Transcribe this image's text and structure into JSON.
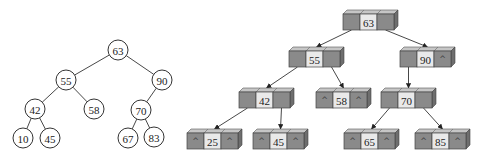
{
  "left_tree": {
    "title": "Binary search tree (logical view)",
    "nodes": [
      {
        "id": "n63",
        "value": "63",
        "x": 118,
        "y": 50
      },
      {
        "id": "n55",
        "value": "55",
        "x": 66,
        "y": 80
      },
      {
        "id": "n90",
        "value": "90",
        "x": 162,
        "y": 80
      },
      {
        "id": "n42",
        "value": "42",
        "x": 35,
        "y": 109
      },
      {
        "id": "n58",
        "value": "58",
        "x": 94,
        "y": 109
      },
      {
        "id": "n70",
        "value": "70",
        "x": 141,
        "y": 110
      },
      {
        "id": "n10",
        "value": "10",
        "x": 23,
        "y": 138
      },
      {
        "id": "n45",
        "value": "45",
        "x": 50,
        "y": 138
      },
      {
        "id": "n67",
        "value": "67",
        "x": 128,
        "y": 138
      },
      {
        "id": "n83",
        "value": "83",
        "x": 154,
        "y": 137
      }
    ],
    "edges": [
      [
        "n63",
        "n55"
      ],
      [
        "n63",
        "n90"
      ],
      [
        "n55",
        "n42"
      ],
      [
        "n55",
        "n58"
      ],
      [
        "n90",
        "n70"
      ],
      [
        "n42",
        "n10"
      ],
      [
        "n42",
        "n45"
      ],
      [
        "n70",
        "n67"
      ],
      [
        "n70",
        "n83"
      ]
    ],
    "radius": 10
  },
  "right_tree": {
    "title": "Linked node representation",
    "null_symbol": "^",
    "nodes": [
      {
        "id": "b63",
        "value": "63",
        "x": 343,
        "y": 14,
        "left": "",
        "right": ""
      },
      {
        "id": "b55",
        "value": "55",
        "x": 289,
        "y": 51,
        "left": "",
        "right": ""
      },
      {
        "id": "b90",
        "value": "90",
        "x": 400,
        "y": 51,
        "left": "",
        "right": "^"
      },
      {
        "id": "b42",
        "value": "42",
        "x": 239,
        "y": 92,
        "left": "",
        "right": ""
      },
      {
        "id": "b58",
        "value": "58",
        "x": 316,
        "y": 92,
        "left": "^",
        "right": "^"
      },
      {
        "id": "b70",
        "value": "70",
        "x": 381,
        "y": 92,
        "left": "",
        "right": ""
      },
      {
        "id": "b25",
        "value": "25",
        "x": 187,
        "y": 133,
        "left": "^",
        "right": "^"
      },
      {
        "id": "b45",
        "value": "45",
        "x": 253,
        "y": 133,
        "left": "^",
        "right": "^"
      },
      {
        "id": "b65",
        "value": "65",
        "x": 344,
        "y": 133,
        "left": "^",
        "right": "^"
      },
      {
        "id": "b85",
        "value": "85",
        "x": 415,
        "y": 133,
        "left": "^",
        "right": "^"
      }
    ],
    "links": [
      [
        "b63",
        "left",
        "b55"
      ],
      [
        "b63",
        "right",
        "b90"
      ],
      [
        "b55",
        "left",
        "b42"
      ],
      [
        "b55",
        "right",
        "b58"
      ],
      [
        "b90",
        "left",
        "b70"
      ],
      [
        "b42",
        "left",
        "b25"
      ],
      [
        "b42",
        "right",
        "b45"
      ],
      [
        "b70",
        "left",
        "b65"
      ],
      [
        "b70",
        "right",
        "b85"
      ]
    ],
    "cell_width": 17,
    "cell_height": 16
  },
  "colors": {
    "pointer_cell": "#8a8a8a",
    "value_cell": "#e9e9e9",
    "top_face": "#c6c6c6",
    "side_face": "#6e6e6e",
    "line": "#333333"
  }
}
